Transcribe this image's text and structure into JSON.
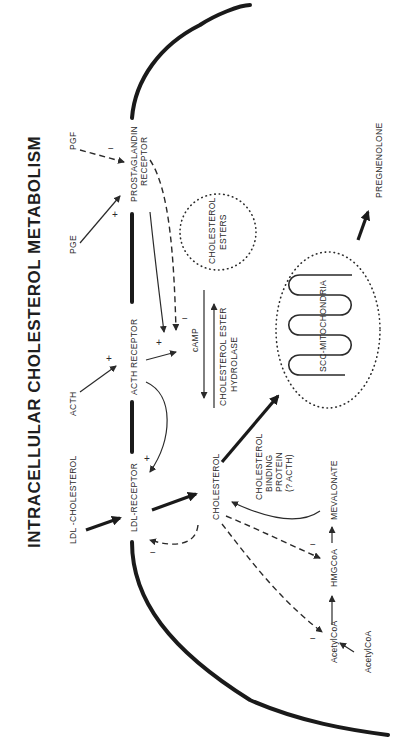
{
  "diagram": {
    "title": "INTRACELLULAR CHOLESTEROL METABOLISM",
    "orientation": "rotated 90° counter-clockwise",
    "external_signals": {
      "ldl_cholesterol": "LDL  -CHOLESTEROL",
      "acth": "ACTH",
      "pge": "PGE",
      "pgf": "PGF"
    },
    "receptors": {
      "ldl_receptor": "LDL-RECEPTOR",
      "acth_receptor": "ACTH RECEPTOR",
      "prostaglandin_receptor_line1": "PROSTAGLANDIN",
      "prostaglandin_receptor_line2": "RECEPTOR"
    },
    "intracellular": {
      "cholesterol": "CHOLESTEROL",
      "camp": "cAMP",
      "hydrolase_line1": "CHOLESTEROL ESTER",
      "hydrolase_line2": "HYDROLASE",
      "esters_line1": "CHOLESTEROL",
      "esters_line2": "ESTERS",
      "binding_protein_line1": "CHOLESTEROL",
      "binding_protein_line2": "BINDING",
      "binding_protein_line3": "PROTEIN",
      "binding_protein_line4": "(? ACTH)",
      "mitochondria": "SCC-MITOCHONDRIA",
      "pregnenolone": "PREGNENOLONE",
      "mevalonate": "MEVALONATE",
      "hmgcoa": "HMGCoA",
      "acetylcoa_1": "AcetylCoA",
      "acetylcoa_2": "AcetylCoA"
    },
    "signs": {
      "plus": "+",
      "minus": "−"
    }
  }
}
